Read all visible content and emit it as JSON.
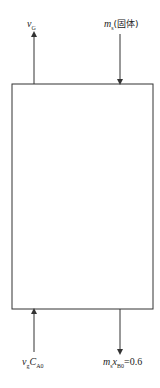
{
  "diagram": {
    "type": "process-flow-block",
    "vessel": {
      "shape": "rectangle",
      "label": ""
    },
    "streams": [
      {
        "id": "gas-out",
        "direction": "out",
        "side": "top-left",
        "symbol": "v",
        "subscript": "G",
        "suffix": ""
      },
      {
        "id": "solid-in",
        "direction": "in",
        "side": "top-right",
        "symbol": "m",
        "subscript": "s",
        "suffix": "(固体)"
      },
      {
        "id": "gas-in",
        "direction": "in",
        "side": "bottom-left",
        "symbol": "v",
        "subscript": "g",
        "symbol2": "C",
        "subscript2": "A0",
        "suffix": ""
      },
      {
        "id": "solid-out",
        "direction": "out",
        "side": "bottom-right",
        "symbol": "m",
        "subscript": "s",
        "symbol2": "x",
        "subscript2": "B0",
        "suffix": "=0.6"
      }
    ],
    "colors": {
      "line": "#333333",
      "background": "#ffffff"
    }
  }
}
